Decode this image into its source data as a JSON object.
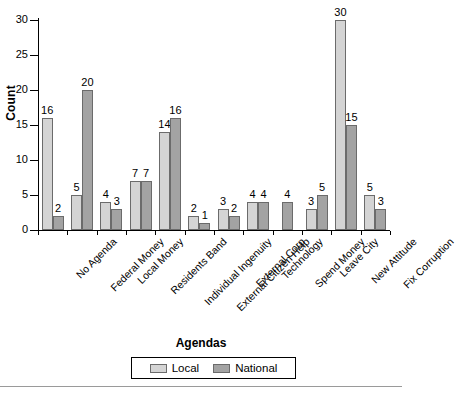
{
  "chart_data": {
    "type": "bar",
    "title": "",
    "xlabel": "Agendas",
    "ylabel": "Count",
    "ylim": [
      0,
      30
    ],
    "yticks": [
      0,
      5,
      10,
      15,
      20,
      25,
      30
    ],
    "grid": false,
    "legend_position": "bottom",
    "categories": [
      "No Agenda",
      "Federal Money",
      "Local Money",
      "Residents Band",
      "Individual Ingenuity",
      "External Citizen Help",
      "External Corp",
      "Technology",
      "Spend Money",
      "Leave City",
      "New Attitude",
      "Fix Corruption"
    ],
    "series": [
      {
        "name": "Local",
        "color": "#d4d4d4",
        "values": [
          16,
          5,
          4,
          7,
          14,
          2,
          3,
          4,
          null,
          3,
          30,
          5
        ]
      },
      {
        "name": "National",
        "color": "#a3a3a3",
        "values": [
          2,
          20,
          3,
          7,
          16,
          1,
          2,
          4,
          4,
          5,
          15,
          3
        ]
      }
    ]
  },
  "legend": {
    "items": [
      {
        "label": "Local",
        "swatch": "local-swatch"
      },
      {
        "label": "National",
        "swatch": "national-swatch"
      }
    ]
  }
}
